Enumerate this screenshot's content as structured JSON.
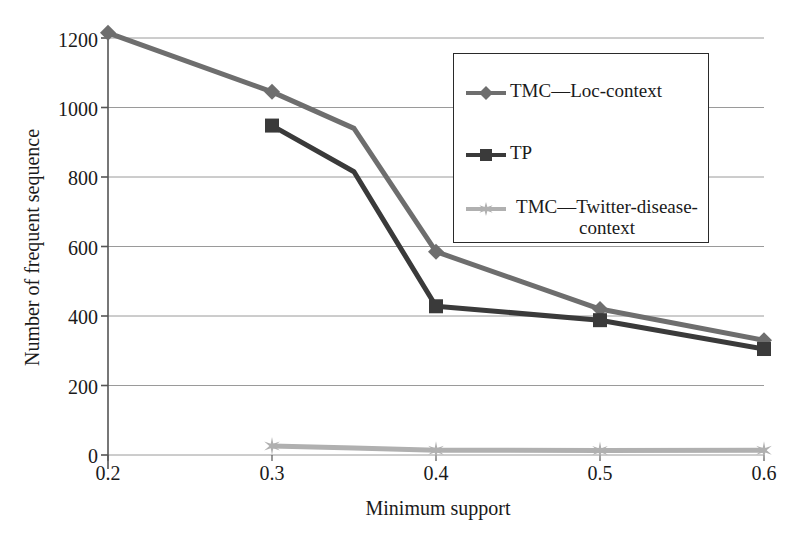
{
  "chart_data": {
    "type": "line",
    "title": "",
    "subtitle": "",
    "xlabel": "Minimum support",
    "ylabel": "Number of frequent sequence",
    "x": [
      0.2,
      0.3,
      0.35,
      0.4,
      0.5,
      0.6
    ],
    "xticklabels": [
      "0.2",
      "0.3",
      "0.4",
      "0.5",
      "0.6"
    ],
    "xtickvalues": [
      0.2,
      0.3,
      0.4,
      0.5,
      0.6
    ],
    "xlim": [
      0.2,
      0.6
    ],
    "ylim": [
      0,
      1200
    ],
    "yticklabels": [
      "0",
      "200",
      "400",
      "600",
      "800",
      "1000",
      "1200"
    ],
    "ytickvalues": [
      0,
      200,
      400,
      600,
      800,
      1000,
      1200
    ],
    "grid": "horizontal",
    "legend_position": "upper-right-inset",
    "series": [
      {
        "name": "TMC—Loc-context",
        "color": "#6e6e6e",
        "marker": "diamond",
        "x": [
          0.2,
          0.3,
          0.35,
          0.4,
          0.5,
          0.6
        ],
        "values": [
          1215,
          1045,
          940,
          585,
          420,
          330
        ]
      },
      {
        "name": "TP",
        "color": "#3a3a3a",
        "marker": "square",
        "x": [
          0.3,
          0.35,
          0.4,
          0.5,
          0.6
        ],
        "values": [
          948,
          815,
          428,
          388,
          305
        ]
      },
      {
        "name": "TMC—Twitter-disease-context",
        "color": "#b0b0b0",
        "marker": "star",
        "x": [
          0.3,
          0.35,
          0.4,
          0.5,
          0.6
        ],
        "values": [
          26,
          20,
          14,
          13,
          14
        ]
      }
    ],
    "legend": [
      {
        "label": "TMC—Loc-context",
        "color": "#6e6e6e",
        "marker": "diamond"
      },
      {
        "label": "TP",
        "color": "#3a3a3a",
        "marker": "square"
      },
      {
        "label_line1": "TMC—Twitter-disease-",
        "label_line2": "context",
        "color": "#b0b0b0",
        "marker": "star"
      }
    ]
  },
  "axes": {
    "ylabel": "Number of frequent sequence",
    "xlabel": "Minimum support",
    "yticks": [
      "1200",
      "1000",
      "800",
      "600",
      "400",
      "200",
      "0"
    ],
    "xticks": [
      "0.2",
      "0.3",
      "0.4",
      "0.5",
      "0.6"
    ]
  },
  "colors": {
    "series1": "#6e6e6e",
    "series2": "#3a3a3a",
    "series3": "#b0b0b0",
    "gridline": "#9a9a9a",
    "axis": "#555555",
    "text": "#1a1a1a",
    "background": "#ffffff"
  }
}
